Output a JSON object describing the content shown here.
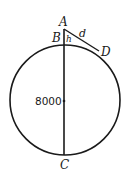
{
  "diagram": {
    "type": "geometry",
    "labels": {
      "A": "A",
      "B": "B",
      "C": "C",
      "D": "D",
      "h": "h",
      "d": "d",
      "diameter": "8000"
    },
    "colors": {
      "stroke": "#1a1a1a",
      "background": "#ffffff"
    }
  }
}
